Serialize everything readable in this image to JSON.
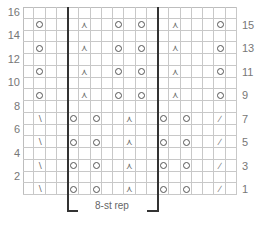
{
  "chart": {
    "type": "knitting-chart",
    "columns": 19,
    "rows": 16,
    "repeat": {
      "label": "8-st rep",
      "start_col": 4,
      "end_col": 11
    },
    "left_row_labels": [
      "16",
      "14",
      "12",
      "10",
      "8",
      "6",
      "4",
      "2"
    ],
    "right_row_labels": [
      "15",
      "13",
      "11",
      "9",
      "7",
      "5",
      "3",
      "1"
    ],
    "legend_symbols": {
      "yo": "yarn-over (circle)",
      "ssk": "left-slanting decrease (\\)",
      "k2tog": "right-slanting decrease (/)",
      "cdd": "central double decrease (⋏)"
    },
    "pattern_rows": {
      "upper_odd_rows": [
        9,
        11,
        13,
        15
      ],
      "upper_row_stitches": [
        {
          "col": 1,
          "sym": "yo"
        },
        {
          "col": 5,
          "sym": "cdd"
        },
        {
          "col": 8,
          "sym": "yo"
        },
        {
          "col": 10,
          "sym": "yo"
        },
        {
          "col": 13,
          "sym": "cdd"
        },
        {
          "col": 17,
          "sym": "yo"
        }
      ],
      "lower_odd_rows": [
        1,
        3,
        5,
        7
      ],
      "lower_row_stitches": [
        {
          "col": 1,
          "sym": "ssk"
        },
        {
          "col": 4,
          "sym": "yo"
        },
        {
          "col": 6,
          "sym": "yo"
        },
        {
          "col": 9,
          "sym": "cdd"
        },
        {
          "col": 12,
          "sym": "yo"
        },
        {
          "col": 14,
          "sym": "yo"
        },
        {
          "col": 17,
          "sym": "k2tog"
        }
      ]
    }
  },
  "chart_data": {
    "type": "table",
    "repeat_label": "8-st rep",
    "row_labels_left": [
      16,
      14,
      12,
      10,
      8,
      6,
      4,
      2
    ],
    "row_labels_right": [
      15,
      13,
      11,
      9,
      7,
      5,
      3,
      1
    ]
  }
}
